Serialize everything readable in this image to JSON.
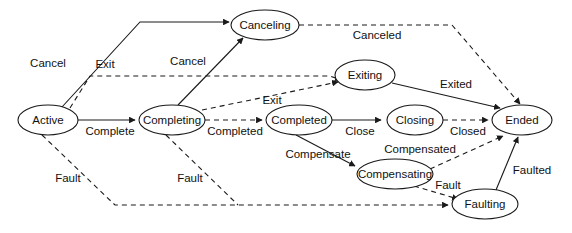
{
  "diagram": {
    "type": "state-machine",
    "title": "",
    "width": 572,
    "height": 233,
    "colors": {
      "background": "#ffffff",
      "stroke": "#1a1a1a",
      "node_fill": "#ffffff",
      "text": "#111111"
    },
    "nodes": [
      {
        "id": "active",
        "label": "Active",
        "cx": 48,
        "cy": 120,
        "rx": 30,
        "ry": 15
      },
      {
        "id": "completing",
        "label": "Completing",
        "cx": 172,
        "cy": 120,
        "rx": 33,
        "ry": 15
      },
      {
        "id": "canceling",
        "label": "Canceling",
        "cx": 265,
        "cy": 25,
        "rx": 34,
        "ry": 15
      },
      {
        "id": "exiting",
        "label": "Exiting",
        "cx": 365,
        "cy": 75,
        "rx": 30,
        "ry": 15
      },
      {
        "id": "completed",
        "label": "Completed",
        "cx": 299,
        "cy": 120,
        "rx": 33,
        "ry": 15
      },
      {
        "id": "closing",
        "label": "Closing",
        "cx": 415,
        "cy": 120,
        "rx": 28,
        "ry": 15
      },
      {
        "id": "ended",
        "label": "Ended",
        "cx": 522,
        "cy": 120,
        "rx": 30,
        "ry": 15
      },
      {
        "id": "compensating",
        "label": "Compensating",
        "cx": 395,
        "cy": 174,
        "rx": 38,
        "ry": 15
      },
      {
        "id": "faulting",
        "label": "Faulting",
        "cx": 485,
        "cy": 204,
        "rx": 33,
        "ry": 15
      }
    ],
    "edges": [
      {
        "id": "active-canceling",
        "from": "Active",
        "to": "Canceling",
        "label": "Cancel",
        "style": "solid",
        "label_x": 48,
        "label_y": 64
      },
      {
        "id": "active-exiting",
        "from": "Active",
        "to": "Exiting",
        "label": "Exit",
        "style": "dashed",
        "label_x": 105,
        "label_y": 65
      },
      {
        "id": "active-completing",
        "from": "Active",
        "to": "Completing",
        "label": "Complete",
        "style": "solid",
        "label_x": 110,
        "label_y": 132
      },
      {
        "id": "active-faulting",
        "from": "Active",
        "to": "Faulting",
        "label": "Fault",
        "style": "dashed",
        "label_x": 68,
        "label_y": 179
      },
      {
        "id": "completing-canceling",
        "from": "Completing",
        "to": "Canceling",
        "label": "Cancel",
        "style": "solid",
        "label_x": 188,
        "label_y": 62
      },
      {
        "id": "completing-exiting",
        "from": "Completing",
        "to": "Exiting",
        "label": "Exit",
        "style": "dashed",
        "label_x": 272,
        "label_y": 101
      },
      {
        "id": "completing-completed",
        "from": "Completing",
        "to": "Completed",
        "label": "Completed",
        "style": "dashed",
        "label_x": 235,
        "label_y": 132
      },
      {
        "id": "completing-faulting",
        "from": "Completing",
        "to": "Faulting",
        "label": "Fault",
        "style": "dashed",
        "label_x": 190,
        "label_y": 179
      },
      {
        "id": "canceling-ended",
        "from": "Canceling",
        "to": "Ended",
        "label": "Canceled",
        "style": "dashed",
        "label_x": 377,
        "label_y": 36
      },
      {
        "id": "exiting-ended",
        "from": "Exiting",
        "to": "Ended",
        "label": "Exited",
        "style": "solid",
        "label_x": 456,
        "label_y": 85
      },
      {
        "id": "completed-closing",
        "from": "Completed",
        "to": "Closing",
        "label": "Close",
        "style": "solid",
        "label_x": 360,
        "label_y": 132
      },
      {
        "id": "completed-compensating",
        "from": "Completed",
        "to": "Compensating",
        "label": "Compensate",
        "style": "solid",
        "label_x": 318,
        "label_y": 155
      },
      {
        "id": "closing-ended",
        "from": "Closing",
        "to": "Ended",
        "label": "Closed",
        "style": "dashed",
        "label_x": 468,
        "label_y": 132
      },
      {
        "id": "compensating-ended",
        "from": "Compensating",
        "to": "Ended",
        "label": "Compensated",
        "style": "dashed",
        "label_x": 420,
        "label_y": 150
      },
      {
        "id": "compensating-faulting",
        "from": "Compensating",
        "to": "Faulting",
        "label": "Fault",
        "style": "dashed",
        "label_x": 448,
        "label_y": 186
      },
      {
        "id": "faulting-ended",
        "from": "Faulting",
        "to": "Ended",
        "label": "Faulted",
        "style": "solid",
        "label_x": 532,
        "label_y": 171
      }
    ]
  }
}
